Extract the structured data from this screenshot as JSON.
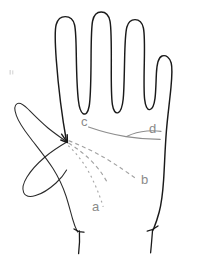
{
  "figure": {
    "background_color": "#ffffff",
    "outline_color": "#1a1a1a",
    "crease_color": "#8e8e8e",
    "label_color": "#8a8a8a",
    "width": 201,
    "height": 263
  },
  "labels": [
    {
      "id": "a",
      "text": "a",
      "x": 92,
      "y": 200,
      "style": "dotted",
      "note": "lowest dotted crease curving down into the palm"
    },
    {
      "id": "b",
      "text": "b",
      "x": 141,
      "y": 173,
      "style": "dashed",
      "note": "middle dashed crease sweeping to lower right"
    },
    {
      "id": "c",
      "text": "c",
      "x": 81,
      "y": 115,
      "style": "solid",
      "note": "upper solid crease running across the palm"
    },
    {
      "id": "d",
      "text": "d",
      "x": 149,
      "y": 122,
      "style": "solid",
      "note": "crease endpoint at the outer edge below the little finger"
    }
  ],
  "parts": [
    {
      "id": "thumb",
      "name": "thumb"
    },
    {
      "id": "index-finger",
      "name": "index finger"
    },
    {
      "id": "middle-finger",
      "name": "middle finger"
    },
    {
      "id": "ring-finger",
      "name": "ring finger"
    },
    {
      "id": "little-finger",
      "name": "little finger"
    },
    {
      "id": "palm",
      "name": "palm"
    },
    {
      "id": "wrist",
      "name": "wrist"
    }
  ]
}
